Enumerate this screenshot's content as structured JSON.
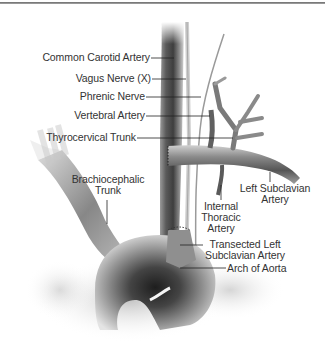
{
  "figure": {
    "labels": {
      "common_carotid": "Common Carotid Artery",
      "vagus": "Vagus Nerve (X)",
      "phrenic": "Phrenic Nerve",
      "vertebral": "Vertebral Artery",
      "thyrocervical": "Thyrocervical Trunk",
      "brachiocephalic_1": "Brachiocephalic",
      "brachiocephalic_2": "Trunk",
      "left_subclavian_1": "Left Subclavian",
      "left_subclavian_2": "Artery",
      "internal_thoracic_1": "Internal",
      "internal_thoracic_2": "Thoracic",
      "internal_thoracic_3": "Artery",
      "transected_1": "Transected Left",
      "transected_2": "Subclavian Artery",
      "arch": "Arch of Aorta"
    },
    "colors": {
      "rule": "#6a6a6a",
      "label_text": "#333333",
      "leader_line": "#222222",
      "vessel_dark": "#3a3a3a",
      "vessel_light": "#e0e0e0"
    }
  }
}
